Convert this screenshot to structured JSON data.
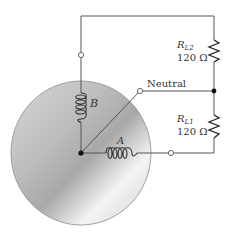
{
  "diagram": {
    "type": "two-phase generator with resistive loads",
    "labels": {
      "coil_b": "B",
      "coil_a": "A",
      "neutral": "Neutral",
      "rl2_name": "R",
      "rl2_sub": "L2",
      "rl2_value": "120 Ω",
      "rl1_name": "R",
      "rl1_sub": "L1",
      "rl1_value": "120 Ω"
    },
    "colors": {
      "wire": "#555555",
      "disc_light": "#f2f2f2",
      "disc_dark": "#a9a9a9",
      "disc_edge": "#8c8c8c",
      "text": "#333333"
    }
  }
}
